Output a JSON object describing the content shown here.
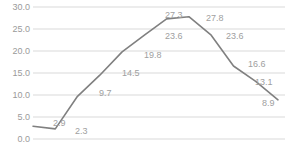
{
  "chart_data": {
    "type": "line",
    "title": "",
    "subtitle": "",
    "xlabel": "",
    "ylabel": "",
    "grid": true,
    "legend": "none",
    "ylim": [
      0,
      30
    ],
    "y_ticks": [
      "0.0",
      "5.0",
      "10.0",
      "15.0",
      "20.0",
      "25.0",
      "30.0"
    ],
    "y_tick_values": [
      0,
      5,
      10,
      15,
      20,
      25,
      30
    ],
    "x": [
      1,
      2,
      3,
      4,
      5,
      6,
      7,
      8,
      9,
      10,
      11,
      12
    ],
    "categories": [
      "",
      "",
      "",
      "",
      "",
      "",
      "",
      "",
      "",
      "",
      "",
      ""
    ],
    "values": [
      2.9,
      2.3,
      9.7,
      14.5,
      19.8,
      23.6,
      27.3,
      27.8,
      23.6,
      16.6,
      13.1,
      8.9
    ],
    "data_labels": [
      "2.9",
      "2.3",
      "9.7",
      "14.5",
      "19.8",
      "23.6",
      "27.3",
      "27.8",
      "23.6",
      "16.6",
      "13.1",
      "8.9"
    ],
    "series": [
      {
        "name": "",
        "values": [
          2.9,
          2.3,
          9.7,
          14.5,
          19.8,
          23.6,
          27.3,
          27.8,
          23.6,
          16.6,
          13.1,
          8.9
        ]
      }
    ],
    "colors": {
      "line": "#808080",
      "gridline": "#d9d9d9",
      "tick_label": "#9a9a9a",
      "data_label": "#a0a0a0",
      "background": "#ffffff"
    }
  }
}
